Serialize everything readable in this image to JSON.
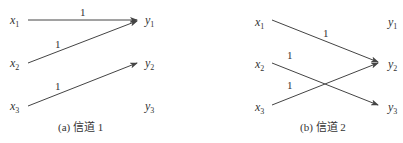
{
  "panels": [
    {
      "id": "a",
      "caption": "(a) 信道 1",
      "inputs": [
        {
          "base": "x",
          "sub": "1"
        },
        {
          "base": "x",
          "sub": "2"
        },
        {
          "base": "x",
          "sub": "3"
        }
      ],
      "outputs": [
        {
          "base": "y",
          "sub": "1"
        },
        {
          "base": "y",
          "sub": "2"
        },
        {
          "base": "y",
          "sub": "3"
        }
      ],
      "edges": [
        {
          "from": "x1",
          "to": "y1",
          "label": "1"
        },
        {
          "from": "x2",
          "to": "y1",
          "label": "1"
        },
        {
          "from": "x3",
          "to": "y2",
          "label": "1"
        }
      ]
    },
    {
      "id": "b",
      "caption": "(b) 信道 2",
      "inputs": [
        {
          "base": "x",
          "sub": "1"
        },
        {
          "base": "x",
          "sub": "2"
        },
        {
          "base": "x",
          "sub": "3"
        }
      ],
      "outputs": [
        {
          "base": "y",
          "sub": "1"
        },
        {
          "base": "y",
          "sub": "2"
        },
        {
          "base": "y",
          "sub": "3"
        }
      ],
      "edges": [
        {
          "from": "x1",
          "to": "y2",
          "label": "1"
        },
        {
          "from": "x2",
          "to": "y3",
          "label": "1"
        },
        {
          "from": "x3",
          "to": "y2",
          "label": "1"
        }
      ]
    }
  ],
  "colors": {
    "line": "#444444",
    "text": "#333333",
    "background": "#ffffff"
  }
}
